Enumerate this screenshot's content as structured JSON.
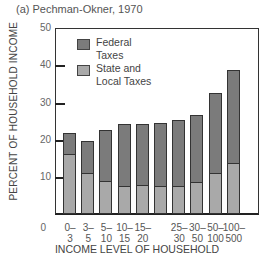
{
  "figure": {
    "title": "(a) Pechman-Okner, 1970",
    "ylabel": "PERCENT OF HOUSEHOLD INCOME",
    "xlabel": "INCOME LEVEL OF HOUSEHOLD",
    "zero_label": "0"
  },
  "legend": {
    "federal_line1": "Federal",
    "federal_line2": "Taxes",
    "state_line1": "State and",
    "state_line2": "Local Taxes",
    "federal_color": "#7b7b7b",
    "state_color": "#a9a9a9"
  },
  "yticks": [
    "50",
    "40",
    "30",
    "20",
    "10"
  ],
  "xticks": [
    {
      "l1": "0–",
      "l2": "3"
    },
    {
      "l1": "3–",
      "l2": "5"
    },
    {
      "l1": "5–",
      "l2": "10"
    },
    {
      "l1": "10–",
      "l2": "15"
    },
    {
      "l1": "15–",
      "l2": "20"
    },
    {
      "l1": "",
      "l2": ""
    },
    {
      "l1": "25–",
      "l2": "30"
    },
    {
      "l1": "30–",
      "l2": "50"
    },
    {
      "l1": "50–",
      "l2": "100"
    },
    {
      "l1": "100–",
      "l2": "500"
    }
  ],
  "chart_data": {
    "type": "bar",
    "stacked": true,
    "title": "(a) Pechman-Okner, 1970",
    "xlabel": "INCOME LEVEL OF HOUSEHOLD",
    "ylabel": "PERCENT OF HOUSEHOLD INCOME",
    "ylim": [
      0,
      50
    ],
    "yticks": [
      10,
      20,
      30,
      40,
      50
    ],
    "categories": [
      "0-3",
      "3-5",
      "5-10",
      "10-15",
      "15-20",
      "20-25 (unlabeled)",
      "25-30",
      "30-50",
      "50-100",
      "100-500"
    ],
    "series": [
      {
        "name": "State and Local Taxes",
        "values": [
          15.6,
          10.5,
          8.3,
          7.0,
          7.3,
          7.0,
          7.0,
          8.1,
          10.5,
          13.2
        ]
      },
      {
        "name": "Federal Taxes",
        "values": [
          6.2,
          9.1,
          14.3,
          17.2,
          16.9,
          17.5,
          18.3,
          18.5,
          22.0,
          25.5
        ]
      }
    ],
    "totals": [
      21.8,
      19.6,
      22.6,
      24.2,
      24.2,
      24.5,
      25.3,
      26.6,
      32.5,
      38.7
    ],
    "legend_position": "upper left inside",
    "grid": false
  }
}
